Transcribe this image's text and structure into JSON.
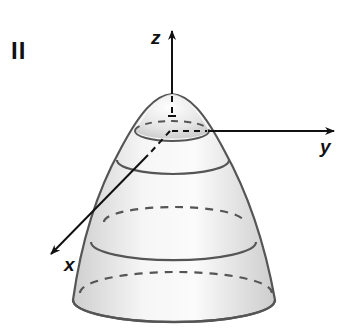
{
  "figure": {
    "panel_label": "II",
    "surface": "elliptic paraboloid opening downward (level curves shown as ellipses)",
    "axes": {
      "x": {
        "label": "x"
      },
      "y": {
        "label": "y"
      },
      "z": {
        "label": "z"
      }
    },
    "colors": {
      "stroke": "#555555",
      "axis": "#111111",
      "fill_light": "#f4f4f4",
      "fill_dark": "#c9c9c9",
      "background": "#ffffff"
    },
    "level_curves": [
      {
        "name": "top",
        "cy": 131,
        "rx": 37,
        "ry": 9,
        "style": "front-solid/back-dashed"
      },
      {
        "name": "upper",
        "cy": 170,
        "rx": 56,
        "ry": 12,
        "style": "front-solid"
      },
      {
        "name": "middle-back",
        "cy": 218,
        "rx": 73,
        "ry": 15,
        "style": "back-dashed"
      },
      {
        "name": "lower",
        "cy": 247,
        "rx": 82,
        "ry": 17,
        "style": "front-solid"
      },
      {
        "name": "low-back",
        "cy": 288,
        "rx": 96,
        "ry": 20,
        "style": "back-dashed"
      },
      {
        "name": "base",
        "cy": 300,
        "rx": 101,
        "ry": 22,
        "style": "front-solid/back-dashed"
      }
    ]
  }
}
